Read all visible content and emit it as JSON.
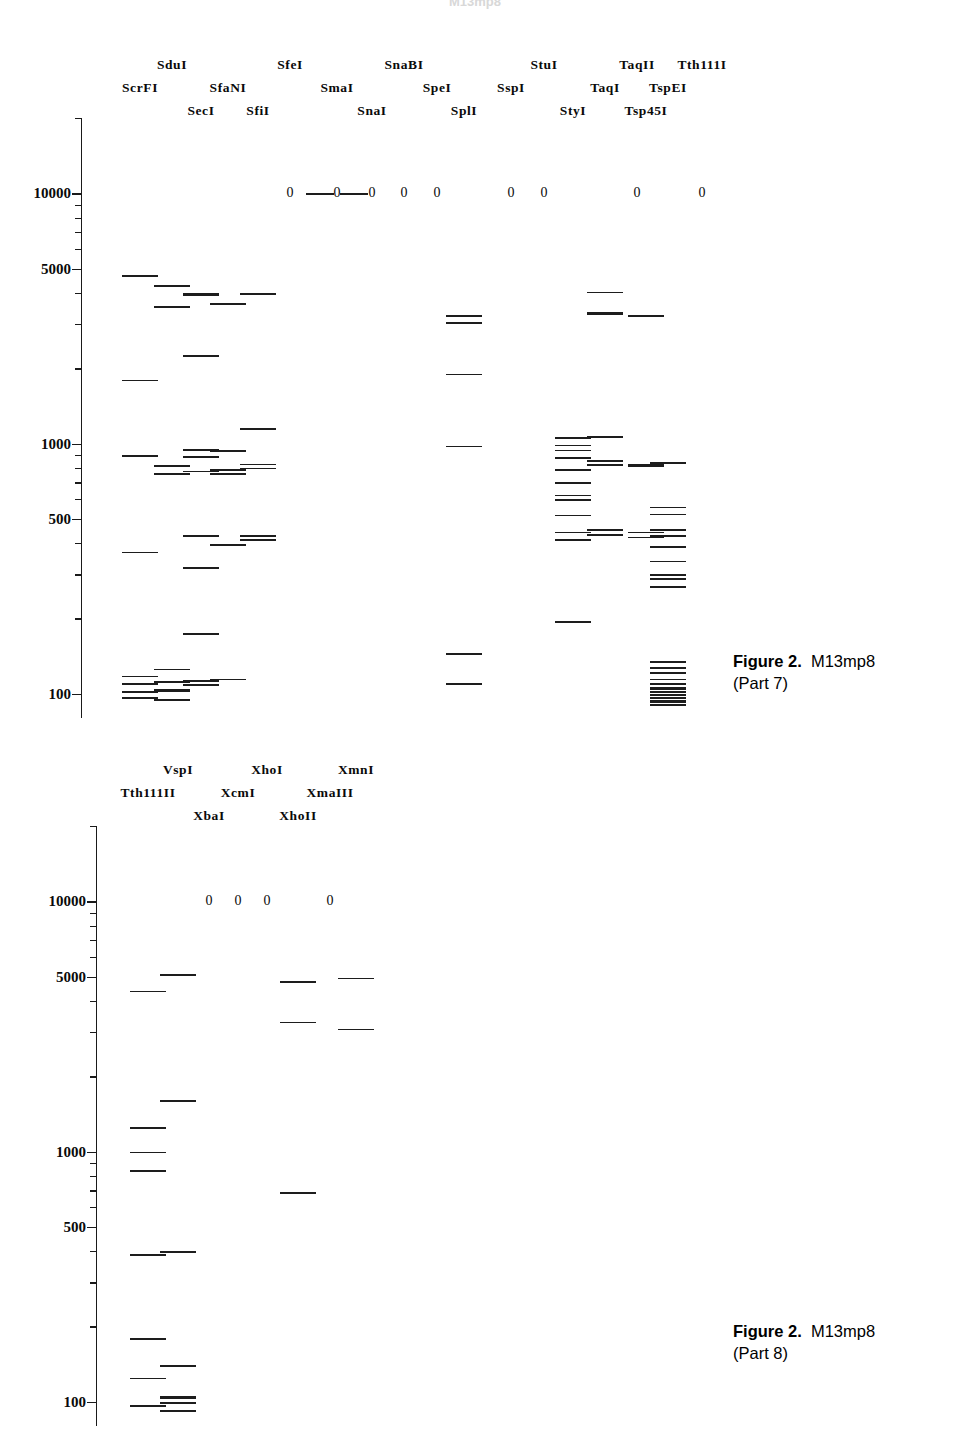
{
  "document": {
    "top_fragment_text": "M13mp8"
  },
  "panels": [
    {
      "id": "part7",
      "caption_title": "Figure 2.",
      "caption_subject": "M13mp8",
      "caption_part": "(Part 7)",
      "axis": {
        "type": "log",
        "labels": [
          "10000",
          "5000",
          "1000",
          "500",
          "100"
        ],
        "label_values": [
          10000,
          5000,
          1000,
          500,
          100
        ],
        "range_top": 20000,
        "range_bottom": 80,
        "pixel_top": 118,
        "pixel_bottom": 718
      },
      "lanes": [
        {
          "name": "ScrFI",
          "row": 1,
          "x": 140,
          "zero": false,
          "bands": [
            4700,
            1800,
            900,
            370,
            118,
            110,
            103,
            97
          ]
        },
        {
          "name": "SduI",
          "row": 0,
          "x": 172,
          "zero": false,
          "bands": [
            4300,
            3550,
            820,
            760,
            126,
            112,
            104,
            95
          ]
        },
        {
          "name": "SecI",
          "row": 2,
          "x": 201,
          "zero": false,
          "bands": [
            4000,
            3950,
            2250,
            950,
            890,
            780,
            430,
            320,
            175,
            113,
            109
          ]
        },
        {
          "name": "SfaNI",
          "row": 1,
          "x": 228,
          "zero": false,
          "bands": [
            3650,
            940,
            790,
            760,
            395,
            115
          ]
        },
        {
          "name": "SfiI",
          "row": 2,
          "x": 258,
          "zero": false,
          "bands": [
            4000,
            1150,
            830,
            800,
            430,
            415
          ]
        },
        {
          "name": "SfeI",
          "row": 0,
          "x": 290,
          "zero": true,
          "zero_rule": true,
          "bands": []
        },
        {
          "name": "SmaI",
          "row": 1,
          "x": 337,
          "zero": true,
          "bands": []
        },
        {
          "name": "SnaI",
          "row": 2,
          "x": 372,
          "zero": true,
          "bands": []
        },
        {
          "name": "SnaBI",
          "row": 0,
          "x": 404,
          "zero": true,
          "bands": []
        },
        {
          "name": "SpeI",
          "row": 1,
          "x": 437,
          "zero": true,
          "bands": []
        },
        {
          "name": "SplI",
          "row": 2,
          "x": 464,
          "zero": false,
          "bands": [
            3250,
            3050,
            1900,
            980,
            145,
            110
          ]
        },
        {
          "name": "SspI",
          "row": 1,
          "x": 511,
          "zero": true,
          "bands": []
        },
        {
          "name": "StuI",
          "row": 0,
          "x": 544,
          "zero": true,
          "bands": []
        },
        {
          "name": "StyI",
          "row": 2,
          "x": 573,
          "zero": false,
          "bands": [
            1060,
            990,
            945,
            880,
            790,
            700,
            625,
            600,
            520,
            445,
            415,
            195
          ]
        },
        {
          "name": "TaqI",
          "row": 1,
          "x": 605,
          "zero": false,
          "bands": [
            4050,
            3350,
            3300,
            1070,
            860,
            825,
            455,
            435
          ]
        },
        {
          "name": "TaqII",
          "row": 0,
          "x": 637,
          "zero": true,
          "bands": []
        },
        {
          "name": "Tsp45I",
          "row": 2,
          "x": 646,
          "zero": false,
          "bands": [
            3250,
            825,
            815,
            445,
            425
          ]
        },
        {
          "name": "TspEI",
          "row": 1,
          "x": 668,
          "zero": false,
          "bands": [
            840,
            560,
            525,
            455,
            430,
            390,
            340,
            300,
            290,
            270,
            135,
            128,
            122,
            115,
            110,
            106,
            103,
            100,
            97,
            94,
            91
          ]
        },
        {
          "name": "Tth111I",
          "row": 0,
          "x": 702,
          "zero": true,
          "bands": []
        }
      ],
      "label_rows_y": [
        57,
        80,
        103
      ]
    },
    {
      "id": "part8",
      "caption_title": "Figure 2.",
      "caption_subject": "M13mp8",
      "caption_part": "(Part 8)",
      "axis": {
        "type": "log",
        "labels": [
          "10000",
          "5000",
          "1000",
          "500",
          "100"
        ],
        "label_values": [
          10000,
          5000,
          1000,
          500,
          100
        ],
        "range_top": 20000,
        "range_bottom": 80,
        "pixel_top": 826,
        "pixel_bottom": 1426
      },
      "lanes": [
        {
          "name": "Tth111II",
          "row": 1,
          "x": 148,
          "zero": false,
          "bands": [
            4400,
            1250,
            1000,
            840,
            390,
            180,
            125,
            97
          ]
        },
        {
          "name": "VspI",
          "row": 0,
          "x": 178,
          "zero": false,
          "bands": [
            5100,
            1600,
            400,
            140,
            105,
            100,
            93
          ]
        },
        {
          "name": "XbaI",
          "row": 2,
          "x": 209,
          "zero": true,
          "bands": []
        },
        {
          "name": "XcmI",
          "row": 1,
          "x": 238,
          "zero": true,
          "bands": []
        },
        {
          "name": "XhoI",
          "row": 0,
          "x": 267,
          "zero": true,
          "bands": []
        },
        {
          "name": "XhoII",
          "row": 2,
          "x": 298,
          "zero": false,
          "bands": [
            4800,
            3300,
            690
          ]
        },
        {
          "name": "XmaIII",
          "row": 1,
          "x": 330,
          "zero": true,
          "bands": []
        },
        {
          "name": "XmnI",
          "row": 0,
          "x": 356,
          "zero": false,
          "bands": [
            4950,
            3100
          ]
        }
      ],
      "label_rows_y": [
        762,
        785,
        808
      ]
    }
  ]
}
